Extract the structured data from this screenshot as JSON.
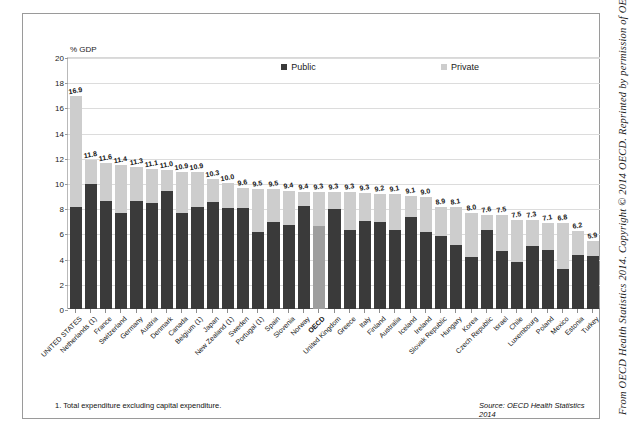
{
  "credit": {
    "text": "From OECD Health Statistics 2014. Copyright © 2014 OECD. Reprinted by permission of OECD."
  },
  "footer": {
    "footnote": "1. Total expenditure excluding capital expenditure.",
    "source": "Source: OECD Health Statistics 2014"
  },
  "legend": [
    {
      "label": "Public",
      "color": "#3a3a3a"
    },
    {
      "label": "Private",
      "color": "#cdcdcd"
    }
  ],
  "axis": {
    "y_caption": "% GDP",
    "y_ticks": [
      "0",
      "2",
      "4",
      "6",
      "8",
      "10",
      "12",
      "14",
      "16",
      "18",
      "20"
    ]
  },
  "chart_data": {
    "type": "bar",
    "title": "",
    "subtitle": "",
    "xlabel": "",
    "ylabel": "% GDP",
    "ylim": [
      0,
      20
    ],
    "ytick_step": 2,
    "grid": true,
    "legend_position": "top-inside",
    "stacked": true,
    "annotations": [
      "1. Total expenditure excluding capital expenditure.",
      "Source: OECD Health Statistics 2014"
    ],
    "categories": [
      "UNITED STATES",
      "Netherlands (1)",
      "France",
      "Switzerland",
      "Germany",
      "Austria",
      "Denmark",
      "Canada",
      "Belgium (1)",
      "Japan",
      "New Zealand (1)",
      "Sweden",
      "Portugal (1)",
      "Spain",
      "Slovenia",
      "Norway",
      "OECD",
      "United Kingdom",
      "Greece",
      "Italy",
      "Finland",
      "Australia",
      "Iceland",
      "Ireland",
      "Slovak Republic",
      "Hungary",
      "Korea",
      "Czech Republic",
      "Israel",
      "Chile",
      "Luxembourg",
      "Poland",
      "Mexico",
      "Estonia",
      "Turkey"
    ],
    "totals": [
      16.9,
      11.8,
      11.6,
      11.4,
      11.3,
      11.1,
      11.0,
      10.9,
      10.9,
      10.3,
      10.0,
      9.6,
      9.5,
      9.5,
      9.4,
      9.4,
      9.3,
      9.3,
      9.3,
      9.3,
      9.2,
      9.1,
      9.1,
      9.0,
      8.9,
      8.1,
      8.0,
      7.6,
      7.5,
      7.5,
      7.3,
      7.1,
      6.8,
      6.2,
      5.9,
      5.4
    ],
    "series": [
      {
        "name": "Public",
        "values": [
          8.1,
          9.9,
          8.6,
          7.6,
          8.6,
          8.4,
          9.4,
          7.6,
          8.1,
          8.5,
          8.0,
          8.0,
          6.1,
          6.9,
          6.7,
          8.2,
          6.6,
          7.9,
          6.3,
          7.0,
          6.9,
          6.3,
          7.3,
          6.1,
          5.8,
          5.1,
          4.1,
          6.3,
          4.6,
          3.7,
          5.0,
          4.7,
          3.2,
          4.3,
          4.2
        ],
        "color": "#3a3a3a"
      },
      {
        "name": "Private",
        "values": [
          8.8,
          1.9,
          3.0,
          3.8,
          2.7,
          2.7,
          1.6,
          3.3,
          2.8,
          1.8,
          2.0,
          1.6,
          3.4,
          2.6,
          2.7,
          1.1,
          2.7,
          1.4,
          3.0,
          2.2,
          2.2,
          2.8,
          1.7,
          2.8,
          2.3,
          3.0,
          3.5,
          1.2,
          2.9,
          3.4,
          2.1,
          2.1,
          3.6,
          1.9,
          1.2
        ],
        "color": "#cdcdcd"
      }
    ],
    "labels": [
      "16.9",
      "11.8",
      "11.6",
      "11.4",
      "11.3",
      "11.1",
      "11.0",
      "10.9",
      "10.9",
      "10.3",
      "10.0",
      "9.6",
      "9.5",
      "9.5",
      "9.4",
      "9.4",
      "9.3",
      "9.3",
      "9.3",
      "9.3",
      "9.2",
      "9.1",
      "9.1",
      "9.0",
      "8.9",
      "8.1",
      "8.0",
      "7.6",
      "7.5",
      "7.5",
      "7.3",
      "7.1",
      "6.8",
      "6.2",
      "5.9",
      "5.4"
    ],
    "highlight_category": "OECD"
  }
}
